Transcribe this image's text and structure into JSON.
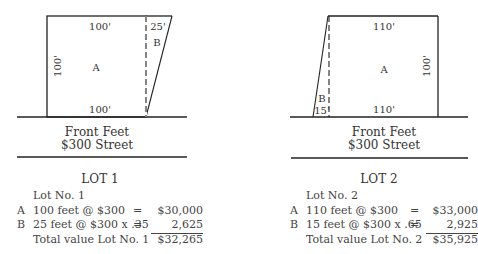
{
  "lots": [
    {
      "title": "LOT 1",
      "street": {
        "line1": "Front Feet",
        "line2": "$300 Street"
      },
      "diagram": {
        "parcel_a_label": "A",
        "parcel_b_label": "B",
        "top_a_dim": "100'",
        "top_b_dim": "25'",
        "side_dim": "100'",
        "front_dim": "100'"
      },
      "calc": {
        "header": "Lot No. 1",
        "rows": [
          {
            "letter": "A",
            "desc": "100 feet @ $300",
            "eq": "=",
            "amount": "$30,000"
          },
          {
            "letter": "B",
            "desc": "25 feet @ $300 x .35",
            "eq": "=",
            "amount": "2,625"
          }
        ],
        "total_label": "Total value Lot No. 1",
        "total_amount": "$32,265"
      }
    },
    {
      "title": "LOT 2",
      "street": {
        "line1": "Front Feet",
        "line2": "$300 Street"
      },
      "diagram": {
        "parcel_a_label": "A",
        "parcel_b_label": "B",
        "top_a_dim": "110'",
        "front_b_dim": "15'",
        "side_dim": "100'",
        "front_dim": "110'"
      },
      "calc": {
        "header": "Lot No. 2",
        "rows": [
          {
            "letter": "A",
            "desc": "110 feet @ $300",
            "eq": "=",
            "amount": "$33,000"
          },
          {
            "letter": "B",
            "desc": "15 feet @ $300 x .65",
            "eq": "=",
            "amount": "2,925"
          }
        ],
        "total_label": "Total value Lot No. 2",
        "total_amount": "$35,925"
      }
    }
  ]
}
